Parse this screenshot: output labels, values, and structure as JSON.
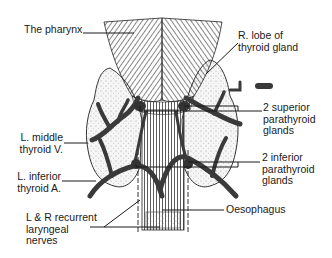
{
  "diagram": {
    "labels": {
      "pharynx": "The pharynx",
      "r_lobe": "R. lobe of\nthyroid gland",
      "superior_parathyroid": "2 superior\nparathyroid\nglands",
      "l_middle_thyroid_v": "L. middle\nthyroid V.",
      "inferior_parathyroid": "2 inferior\nparathyroid\nglands",
      "l_inferior_thyroid_a": "L. inferior\nthyroid A.",
      "recurrent_nerves": "L & R recurrent\nlaryngeal\nnerves",
      "oesophagus": "Oesophagus"
    },
    "colors": {
      "ink": "#1a1a1a",
      "vessel": "#3a3a3a",
      "gland_fill": "#f4f4f4",
      "background": "#ffffff"
    }
  }
}
